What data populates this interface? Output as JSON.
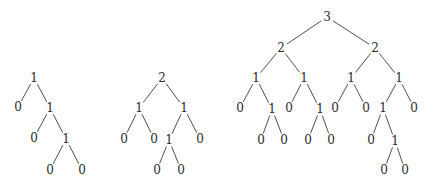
{
  "diagram": {
    "type": "tree-diagrams",
    "trees": [
      {
        "name": "tree-1",
        "nodes": [
          {
            "id": "a",
            "label": "1",
            "x": 34,
            "y": 78
          },
          {
            "id": "b",
            "label": "0",
            "x": 18,
            "y": 107
          },
          {
            "id": "c",
            "label": "1",
            "x": 50,
            "y": 108
          },
          {
            "id": "d",
            "label": "0",
            "x": 34,
            "y": 138
          },
          {
            "id": "e",
            "label": "1",
            "x": 66,
            "y": 139
          },
          {
            "id": "f",
            "label": "0",
            "x": 50,
            "y": 170
          },
          {
            "id": "g",
            "label": "0",
            "x": 82,
            "y": 170
          }
        ],
        "edges": [
          [
            "a",
            "b"
          ],
          [
            "a",
            "c"
          ],
          [
            "c",
            "d"
          ],
          [
            "c",
            "e"
          ],
          [
            "e",
            "f"
          ],
          [
            "e",
            "g"
          ]
        ]
      },
      {
        "name": "tree-2",
        "nodes": [
          {
            "id": "a",
            "label": "2",
            "x": 162,
            "y": 78
          },
          {
            "id": "b",
            "label": "1",
            "x": 139,
            "y": 108
          },
          {
            "id": "c",
            "label": "1",
            "x": 184,
            "y": 108
          },
          {
            "id": "d",
            "label": "0",
            "x": 124,
            "y": 139
          },
          {
            "id": "e",
            "label": "0",
            "x": 154,
            "y": 139
          },
          {
            "id": "f",
            "label": "1",
            "x": 169,
            "y": 140
          },
          {
            "id": "g",
            "label": "0",
            "x": 200,
            "y": 139
          },
          {
            "id": "h",
            "label": "0",
            "x": 157,
            "y": 170
          },
          {
            "id": "i",
            "label": "0",
            "x": 181,
            "y": 170
          }
        ],
        "edges": [
          [
            "a",
            "b"
          ],
          [
            "a",
            "c"
          ],
          [
            "b",
            "d"
          ],
          [
            "b",
            "e"
          ],
          [
            "c",
            "f"
          ],
          [
            "c",
            "g"
          ],
          [
            "f",
            "h"
          ],
          [
            "f",
            "i"
          ]
        ]
      },
      {
        "name": "tree-3",
        "nodes": [
          {
            "id": "r",
            "label": "3",
            "x": 327,
            "y": 17
          },
          {
            "id": "l",
            "label": "2",
            "x": 281,
            "y": 48
          },
          {
            "id": "rr",
            "label": "2",
            "x": 375,
            "y": 48
          },
          {
            "id": "l1",
            "label": "1",
            "x": 256,
            "y": 78
          },
          {
            "id": "l2",
            "label": "1",
            "x": 304,
            "y": 78
          },
          {
            "id": "r1",
            "label": "1",
            "x": 351,
            "y": 78
          },
          {
            "id": "r2",
            "label": "1",
            "x": 399,
            "y": 78
          },
          {
            "id": "l1a",
            "label": "0",
            "x": 240,
            "y": 108
          },
          {
            "id": "l1b",
            "label": "1",
            "x": 272,
            "y": 109
          },
          {
            "id": "l2a",
            "label": "0",
            "x": 289,
            "y": 108
          },
          {
            "id": "l2b",
            "label": "1",
            "x": 320,
            "y": 109
          },
          {
            "id": "r1a",
            "label": "0",
            "x": 335,
            "y": 108
          },
          {
            "id": "r1b",
            "label": "0",
            "x": 366,
            "y": 108
          },
          {
            "id": "r2a",
            "label": "1",
            "x": 383,
            "y": 108
          },
          {
            "id": "r2b",
            "label": "0",
            "x": 414,
            "y": 108
          },
          {
            "id": "l1b1",
            "label": "0",
            "x": 261,
            "y": 140
          },
          {
            "id": "l1b2",
            "label": "0",
            "x": 284,
            "y": 140
          },
          {
            "id": "l2b1",
            "label": "0",
            "x": 308,
            "y": 140
          },
          {
            "id": "l2b2",
            "label": "0",
            "x": 331,
            "y": 140
          },
          {
            "id": "r2a1",
            "label": "0",
            "x": 371,
            "y": 140
          },
          {
            "id": "r2a2",
            "label": "1",
            "x": 395,
            "y": 141
          },
          {
            "id": "r2a21",
            "label": "0",
            "x": 384,
            "y": 170
          },
          {
            "id": "r2a22",
            "label": "0",
            "x": 405,
            "y": 170
          }
        ],
        "edges": [
          [
            "r",
            "l"
          ],
          [
            "r",
            "rr"
          ],
          [
            "l",
            "l1"
          ],
          [
            "l",
            "l2"
          ],
          [
            "rr",
            "r1"
          ],
          [
            "rr",
            "r2"
          ],
          [
            "l1",
            "l1a"
          ],
          [
            "l1",
            "l1b"
          ],
          [
            "l2",
            "l2a"
          ],
          [
            "l2",
            "l2b"
          ],
          [
            "r1",
            "r1a"
          ],
          [
            "r1",
            "r1b"
          ],
          [
            "r2",
            "r2a"
          ],
          [
            "r2",
            "r2b"
          ],
          [
            "l1b",
            "l1b1"
          ],
          [
            "l1b",
            "l1b2"
          ],
          [
            "l2b",
            "l2b1"
          ],
          [
            "l2b",
            "l2b2"
          ],
          [
            "r2a",
            "r2a1"
          ],
          [
            "r2a",
            "r2a2"
          ],
          [
            "r2a2",
            "r2a21"
          ],
          [
            "r2a2",
            "r2a22"
          ]
        ]
      }
    ]
  }
}
